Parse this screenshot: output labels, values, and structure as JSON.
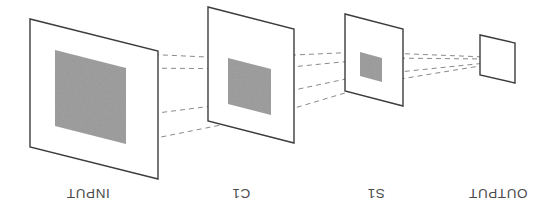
{
  "figure": {
    "orientation": "rotated-180",
    "background_color": "#ffffff",
    "plane_stroke_color": "#3c3c3c",
    "dashed_line_color": "#8a8a8a",
    "patch_fill_color": "#999999",
    "label_color": "#4a4a4a"
  },
  "labels": {
    "output": "OUTPUT",
    "s1": "S1",
    "c1": "C1",
    "input": "INPUT"
  },
  "layers": [
    {
      "id": "input",
      "label": "INPUT",
      "order": 1,
      "plane": {
        "x": 400,
        "y": 36,
        "width": 128,
        "height": 160,
        "shear_y": 32
      },
      "patch": {
        "x": 432,
        "y": 71,
        "width": 71,
        "height": 94,
        "shear_y": 18
      }
    },
    {
      "id": "c1",
      "label": "C1",
      "order": 2,
      "plane": {
        "x": 264,
        "y": 72,
        "width": 86,
        "height": 114,
        "shear_y": 22
      },
      "patch": {
        "x": 287,
        "y": 100,
        "width": 43,
        "height": 57,
        "shear_y": 11
      }
    },
    {
      "id": "s1",
      "label": "S1",
      "order": 3,
      "plane": {
        "x": 155,
        "y": 109,
        "width": 58,
        "height": 77,
        "shear_y": 15
      },
      "patch": {
        "x": 176,
        "y": 133,
        "width": 22,
        "height": 30,
        "shear_y": 6
      }
    },
    {
      "id": "output",
      "label": "OUTPUT",
      "order": 4,
      "plane": {
        "x": 43,
        "y": 132,
        "width": 35,
        "height": 40,
        "shear_y": 8
      },
      "patch": null
    }
  ],
  "label_positions": {
    "output": {
      "x": 60,
      "y": 22
    },
    "s1": {
      "x": 180,
      "y": 22
    },
    "c1": {
      "x": 315,
      "y": 22
    },
    "input": {
      "x": 470,
      "y": 22
    }
  },
  "connections": {
    "description": "Dashed projection lines linking receptive-field patch corners across successive layers",
    "count": 4,
    "style": "dashed"
  }
}
